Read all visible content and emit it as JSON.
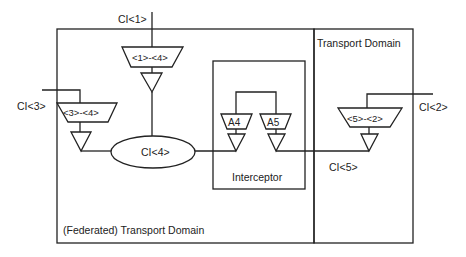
{
  "diagram": {
    "domains": {
      "federated": {
        "label": "(Federated) Transport Domain"
      },
      "transport": {
        "label": "Transport Domain"
      },
      "interceptor": {
        "label": "Interceptor"
      }
    },
    "interfaces": {
      "ci1": "CI<1>",
      "ci2": "CI<2>",
      "ci3": "CI<3>",
      "ci4": "CI<4>",
      "ci5": "CI<5>"
    },
    "adapters": {
      "a1_4": "<1>-<4>",
      "a3_4": "<3>-<4>",
      "a5_2": "<5>-<2>",
      "a4": "A4",
      "a5": "A5"
    },
    "colors": {
      "stroke": "#222222",
      "background": "#ffffff"
    }
  }
}
